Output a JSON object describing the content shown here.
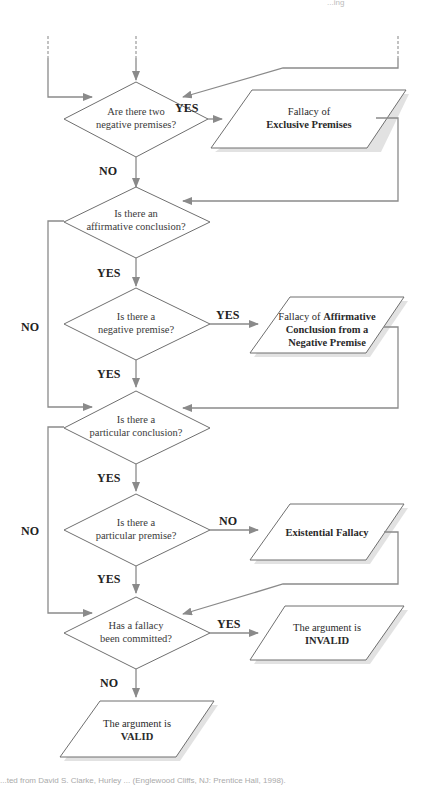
{
  "page_header_fragment": "...ing",
  "flowchart": {
    "decisions": [
      {
        "id": "d1",
        "line1": "Are there two",
        "line2": "negative premises?"
      },
      {
        "id": "d2",
        "line1": "Is there an",
        "line2": "affirmative conclusion?"
      },
      {
        "id": "d3",
        "line1": "Is there a",
        "line2": "negative premise?"
      },
      {
        "id": "d4",
        "line1": "Is there a",
        "line2": "particular conclusion?"
      },
      {
        "id": "d5",
        "line1": "Is there a",
        "line2": "particular premise?"
      },
      {
        "id": "d6",
        "line1": "Has a fallacy",
        "line2": "been committed?"
      }
    ],
    "results": [
      {
        "id": "r1",
        "line1_normal": "Fallacy of",
        "line2_bold": "Exclusive Premises"
      },
      {
        "id": "r2",
        "line1_normal": "Fallacy of ",
        "line1_bold": "Affirmative",
        "line2_bold": "Conclusion from a",
        "line3_bold": "Negative Premise"
      },
      {
        "id": "r3",
        "line1_bold": "Existential Fallacy"
      },
      {
        "id": "r4",
        "line1_normal": "The argument is",
        "line2_bold": "INVALID"
      },
      {
        "id": "r5",
        "line1_normal": "The argument is",
        "line2_bold": "VALID"
      }
    ],
    "edge_labels": {
      "d1_yes": "YES",
      "d1_no": "NO",
      "d2_yes": "YES",
      "d2_no": "NO",
      "d3_yes_right": "YES",
      "d3_yes_down": "YES",
      "d4_yes": "YES",
      "d4_no": "NO",
      "d5_no": "NO",
      "d5_yes": "YES",
      "d6_yes": "YES",
      "d6_no": "NO"
    }
  },
  "caption": "...ted from David S. Clarke, Hurley ... (Englewood Cliffs, NJ: Prentice Hall, 1998)."
}
